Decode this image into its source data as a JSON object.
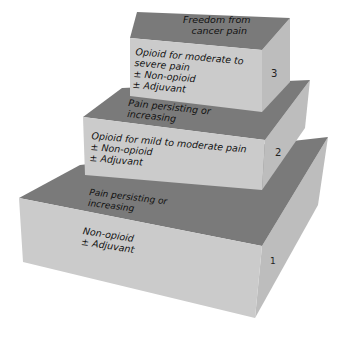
{
  "figure": {
    "type": "pain-ladder-3d-steps",
    "colors": {
      "top": "#7a7a7a",
      "front": "#cbcbcb",
      "side": "#bdbdbd",
      "text": "#111111"
    },
    "summit_label": [
      "Freedom from",
      "cancer pain"
    ],
    "steps": [
      {
        "number": "1",
        "treatment": [
          "Non-opioid",
          "± Adjuvant"
        ],
        "transition": [
          "Pain persisting or",
          "increasing"
        ]
      },
      {
        "number": "2",
        "treatment": [
          "Opioid for mild to moderate pain",
          "± Non-opioid",
          "± Adjuvant"
        ],
        "transition": [
          "Pain persisting or",
          "increasing"
        ]
      },
      {
        "number": "3",
        "treatment": [
          "Opioid for moderate to",
          "severe pain",
          "± Non-opioid",
          "± Adjuvant"
        ]
      }
    ]
  }
}
